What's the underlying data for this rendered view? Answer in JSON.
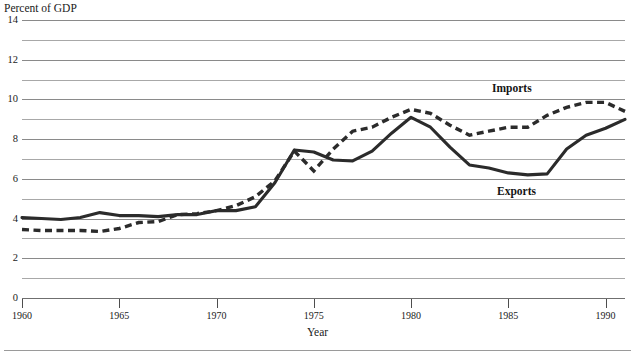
{
  "chart_data": {
    "type": "line",
    "title": "",
    "ylabel": "Percent of GDP",
    "xlabel": "Year",
    "ylim": [
      0,
      14
    ],
    "xlim": [
      1960,
      1991
    ],
    "grid": true,
    "legend_position": "inline-annotation",
    "y_ticks_major": [
      0,
      2,
      4,
      6,
      8,
      10,
      12,
      14
    ],
    "y_ticks_minor": [
      1,
      3,
      5,
      7,
      9,
      11,
      13
    ],
    "y_tick_labels": [
      "0",
      "2",
      "4",
      "6",
      "8",
      "10",
      "12",
      "14"
    ],
    "x_ticks": [
      1960,
      1965,
      1970,
      1975,
      1980,
      1985,
      1990
    ],
    "x_tick_labels": [
      "1960",
      "1965",
      "1970",
      "1975",
      "1980",
      "1985",
      "1990"
    ],
    "x": [
      1960,
      1961,
      1962,
      1963,
      1964,
      1965,
      1966,
      1967,
      1968,
      1969,
      1970,
      1971,
      1972,
      1973,
      1974,
      1975,
      1976,
      1977,
      1978,
      1979,
      1980,
      1981,
      1982,
      1983,
      1984,
      1985,
      1986,
      1987,
      1988,
      1989,
      1990,
      1991
    ],
    "series": [
      {
        "name": "Exports",
        "style": "solid",
        "color": "#2b2b2b",
        "values": [
          4.05,
          4.0,
          3.95,
          4.05,
          4.3,
          4.15,
          4.15,
          4.1,
          4.2,
          4.2,
          4.4,
          4.4,
          4.6,
          5.8,
          7.45,
          7.35,
          6.95,
          6.9,
          7.4,
          8.3,
          9.1,
          8.6,
          7.6,
          6.7,
          6.55,
          6.3,
          6.2,
          6.25,
          7.5,
          8.2,
          8.55,
          9.0
        ]
      },
      {
        "name": "Imports",
        "style": "dashed",
        "color": "#2b2b2b",
        "values": [
          3.45,
          3.4,
          3.4,
          3.4,
          3.35,
          3.5,
          3.8,
          3.85,
          4.2,
          4.25,
          4.4,
          4.65,
          5.1,
          5.9,
          7.4,
          6.4,
          7.5,
          8.4,
          8.6,
          9.1,
          9.5,
          9.3,
          8.7,
          8.2,
          8.4,
          8.6,
          8.6,
          9.2,
          9.6,
          9.85,
          9.85,
          9.4
        ]
      }
    ],
    "annotations": [
      {
        "text": "Imports",
        "x": 1985.5,
        "y": 10.5
      },
      {
        "text": "Exports",
        "x": 1985.8,
        "y": 5.3
      }
    ]
  }
}
